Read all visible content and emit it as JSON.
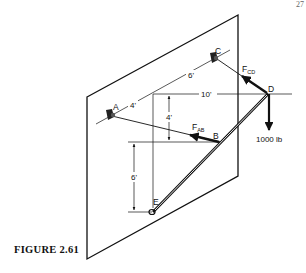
{
  "page": {
    "corner_text": "27"
  },
  "figure": {
    "caption": "FIGURE 2.61",
    "points": {
      "A": "A",
      "B": "B",
      "C": "C",
      "D": "D",
      "E": "E"
    },
    "forces": {
      "fab_main": "F",
      "fab_sub": "AB",
      "fcd_main": "F",
      "fcd_sub": "CD",
      "load": "1000 lb"
    },
    "dimensions": {
      "ac_part1": "4'",
      "ac_part2": "6'",
      "horizontal": "10'",
      "vertical_upper": "4'",
      "vertical_lower": "6'"
    }
  }
}
